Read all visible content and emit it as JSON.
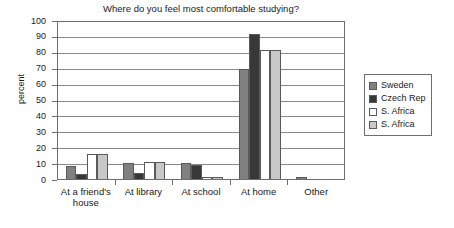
{
  "chart_data": {
    "type": "bar",
    "title": "Where do you feel most comfortable studying?",
    "xlabel": "",
    "ylabel": "percent",
    "ylim": [
      0,
      100
    ],
    "ytick_step": 10,
    "yticks": [
      "100",
      "90",
      "80",
      "70",
      "60",
      "50",
      "40",
      "30",
      "20",
      "10",
      "0"
    ],
    "grid": true,
    "legend_position": "right",
    "categories": [
      "At a friend's house",
      "At library",
      "At school",
      "At home",
      "Other"
    ],
    "category_lines": [
      [
        "At a friend's",
        "house"
      ],
      [
        "At library"
      ],
      [
        "At school"
      ],
      [
        "At home"
      ],
      [
        "Other"
      ]
    ],
    "series": [
      {
        "name": "Sweden",
        "color": "#808080",
        "values": [
          8,
          10,
          10,
          69,
          1
        ]
      },
      {
        "name": "Czech Rep",
        "color": "#383838",
        "values": [
          3,
          4,
          9,
          91,
          0
        ]
      },
      {
        "name": "S. Africa",
        "color": "#ffffff",
        "values": [
          16,
          11,
          1,
          81,
          0
        ]
      },
      {
        "name": "S. Africa",
        "color": "#c8c8c8",
        "values": [
          16,
          11,
          1,
          81,
          0
        ]
      }
    ]
  },
  "colors": {
    "axis": "#6e6e6e",
    "gridline": "#8a8a8a",
    "bar_border": "#5a5a5a",
    "text": "#1a1a1a",
    "background": "#ffffff"
  }
}
